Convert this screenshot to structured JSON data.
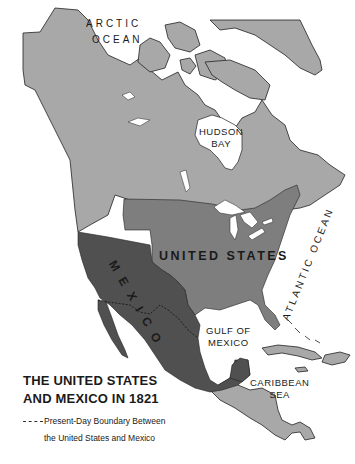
{
  "map": {
    "title_line1": "THE UNITED STATES",
    "title_line2": "AND MEXICO IN 1821",
    "legend": {
      "line_symbol": "dashed-boundary-line",
      "text_line1": "Present-Day Boundary Between",
      "text_line2": "the United States and Mexico"
    },
    "labels": {
      "arctic_1": "ARCTIC",
      "arctic_2": "OCEAN",
      "hudson_1": "HUDSON",
      "hudson_2": "BAY",
      "pacific": "PACIFIC OCEAN",
      "atlantic": "ATLANTIC OCEAN",
      "united_states": "UNITED STATES",
      "mexico": "MEXICO",
      "gulf_1": "GULF OF",
      "gulf_2": "MEXICO",
      "caribbean_1": "CARIBBEAN",
      "caribbean_2": "SEA"
    },
    "colors": {
      "water": "#ffffff",
      "other_land": "#a8a8a8",
      "united_states": "#7e7e7e",
      "mexico": "#505050",
      "coastline": "#222222"
    }
  }
}
